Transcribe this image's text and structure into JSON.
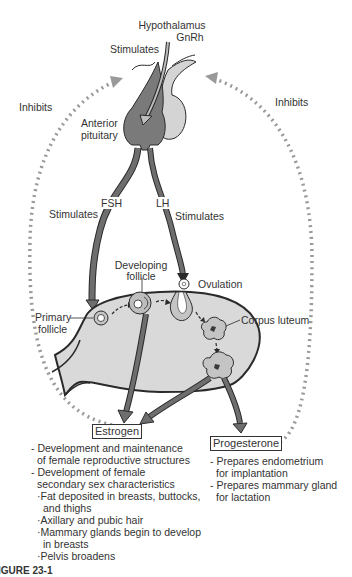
{
  "diagram": {
    "top": {
      "hypothalamus": "Hypothalamus",
      "gnrh": "GnRh",
      "stimulates_gnrh": "Stimulates"
    },
    "pituitary": {
      "label_line1": "Anterior",
      "label_line2": "pituitary"
    },
    "feedback": {
      "left_label": "Inhibits",
      "right_label": "Inhibits"
    },
    "hormones": {
      "fsh": "FSH",
      "lh": "LH",
      "fsh_stimulates": "Stimulates",
      "lh_stimulates": "Stimulates"
    },
    "ovary": {
      "developing_follicle_line1": "Developing",
      "developing_follicle_line2": "follicle",
      "ovulation": "Ovulation",
      "primary_follicle_line1": "Primary",
      "primary_follicle_line2": "follicle",
      "corpus_luteum": "Corpus luteum"
    },
    "estrogen": {
      "label": "Estrogen",
      "effects": [
        {
          "text": "- Development and maintenance",
          "cls": ""
        },
        {
          "text": "of female reproductive structures",
          "cls": "cont"
        },
        {
          "text": "- Development of female",
          "cls": ""
        },
        {
          "text": "secondary sex characteristics",
          "cls": "cont"
        },
        {
          "text": "·Fat deposited in breasts, buttocks,",
          "cls": "sub"
        },
        {
          "text": "and thighs",
          "cls": "subcont"
        },
        {
          "text": "·Axillary and pubic hair",
          "cls": "sub"
        },
        {
          "text": "·Mammary glands begin to develop",
          "cls": "sub"
        },
        {
          "text": "in breasts",
          "cls": "subcont"
        },
        {
          "text": "·Pelvis broadens",
          "cls": "sub"
        }
      ]
    },
    "progesterone": {
      "label": "Progesterone",
      "effects": [
        {
          "text": "- Prepares endometrium",
          "cls": ""
        },
        {
          "text": "for implantation",
          "cls": "cont"
        },
        {
          "text": "- Prepares mammary gland",
          "cls": ""
        },
        {
          "text": "for lactation",
          "cls": "cont"
        }
      ]
    },
    "figure_caption_fragment": "IGURE 23-1"
  },
  "colors": {
    "dark_lobe": "#7a7a7a",
    "light_lobe": "#d4d4d4",
    "ovary_fill": "#d9d9d9",
    "arrow_fill": "#6e6e6e",
    "outline": "#2a2a2a",
    "dots": "#9a9a9a"
  }
}
